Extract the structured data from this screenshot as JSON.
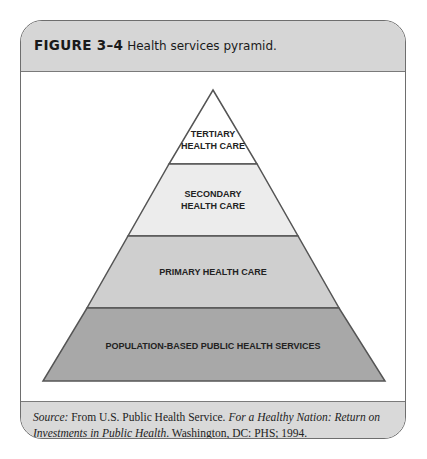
{
  "figure": {
    "number": "FIGURE 3–4",
    "title": "Health services pyramid."
  },
  "pyramid": {
    "levels": [
      {
        "label_lines": [
          "TERTIARY",
          "HEALTH CARE"
        ],
        "fill": "#ffffff"
      },
      {
        "label_lines": [
          "SECONDARY",
          "HEALTH CARE"
        ],
        "fill": "#ececec"
      },
      {
        "label_lines": [
          "PRIMARY HEALTH CARE"
        ],
        "fill": "#cfcfcf"
      },
      {
        "label_lines": [
          "POPULATION-BASED PUBLIC HEALTH SERVICES"
        ],
        "fill": "#a8a8a8"
      }
    ]
  },
  "caption": {
    "source_label": "Source:",
    "text_1": " From U.S. Public Health Service. ",
    "title_italic": "For a Healthy Nation: Return on Investments in Public Health",
    "text_2": ". Washington, DC: PHS; 1994."
  }
}
